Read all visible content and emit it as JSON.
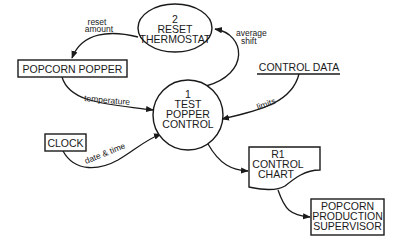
{
  "diagram": {
    "type": "data-flow-diagram",
    "processes": [
      {
        "id": "p1",
        "number": "1",
        "lines": [
          "TEST",
          "POPPER",
          "CONTROL"
        ]
      },
      {
        "id": "p2",
        "number": "2",
        "lines": [
          "RESET",
          "THERMOSTAT"
        ]
      }
    ],
    "externals": [
      {
        "id": "popper",
        "label": "POPCORN POPPER"
      },
      {
        "id": "clock",
        "label": "CLOCK"
      },
      {
        "id": "supervisor",
        "lines": [
          "POPCORN",
          "PRODUCTION",
          "SUPERVISOR"
        ]
      }
    ],
    "data_stores": [
      {
        "id": "control_data",
        "label": "CONTROL DATA"
      }
    ],
    "documents": [
      {
        "id": "r1",
        "lines": [
          "R1",
          "CONTROL",
          "CHART"
        ]
      }
    ],
    "flows": [
      {
        "from": "p2",
        "to": "popper",
        "lines": [
          "reset",
          "amount"
        ]
      },
      {
        "from": "p1",
        "to": "p2",
        "lines": [
          "average",
          "shift"
        ]
      },
      {
        "from": "popper",
        "to": "p1",
        "label": "temperature"
      },
      {
        "from": "control_data",
        "to": "p1",
        "label": "limits"
      },
      {
        "from": "clock",
        "to": "p1",
        "label": "date & time"
      },
      {
        "from": "p1",
        "to": "r1",
        "label": ""
      },
      {
        "from": "r1",
        "to": "supervisor",
        "label": ""
      }
    ]
  }
}
